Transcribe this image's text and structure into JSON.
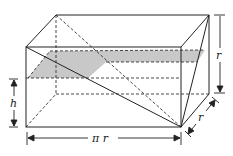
{
  "diagram": {
    "type": "geometry-prism-cross-section",
    "labels": {
      "height_left": "h",
      "height_right": "r",
      "length_bottom": "π r",
      "depth": "r"
    },
    "colors": {
      "line": "#222222",
      "shade": "#c8c8c8",
      "background": "#ffffff"
    }
  }
}
